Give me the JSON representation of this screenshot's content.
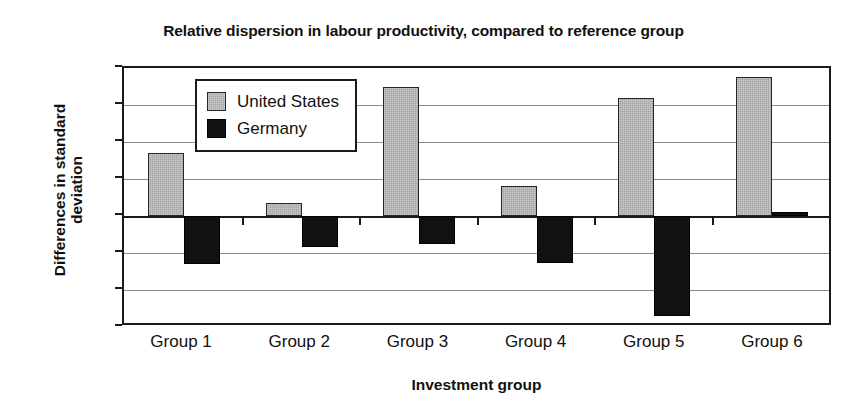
{
  "chart_data": {
    "type": "bar",
    "title": "Relative dispersion in labour productivity, compared to reference group",
    "xlabel": "Investment group",
    "ylabel": "Differences in standard\ndeviation",
    "categories": [
      "Group 1",
      "Group 2",
      "Group 3",
      "Group 4",
      "Group 5",
      "Group 6"
    ],
    "series": [
      {
        "name": "United States",
        "color": "#a3a3a3",
        "values": [
          0.17,
          0.035,
          0.35,
          0.08,
          0.32,
          0.375
        ]
      },
      {
        "name": "Germany",
        "color": "#111111",
        "values": [
          -0.13,
          -0.085,
          -0.075,
          -0.128,
          -0.27,
          0.01
        ]
      }
    ],
    "ylim": [
      -0.3,
      0.4
    ],
    "yticks": [
      0.4,
      0.3,
      0.2,
      0.1,
      0,
      -0.1,
      -0.2,
      -0.3
    ],
    "ytick_labels": [
      "0.4",
      "0.3",
      "0.2",
      "0.1",
      "0",
      "-0.1",
      "-0.2",
      "-0.3"
    ],
    "grid": true,
    "legend_position": "top-left-inside"
  }
}
